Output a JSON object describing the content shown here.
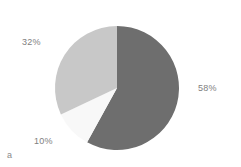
{
  "figure": {
    "caption": "a",
    "background_color": "#ffffff",
    "label_color": "#808080"
  },
  "chart_data": {
    "type": "pie",
    "title": "",
    "xlabel": "",
    "ylabel": "",
    "legend": "none",
    "grid": false,
    "start_angle_deg": 0,
    "direction": "clockwise",
    "categories": [
      "58%",
      "10%",
      "32%"
    ],
    "values": [
      58,
      10,
      32
    ],
    "labels": [
      "58%",
      "10%",
      "32%"
    ],
    "colors": [
      "#6e6e6e",
      "#f8f8f8",
      "#c8c8c8"
    ],
    "slices": [
      {
        "label": "58%",
        "value": 58,
        "color": "#6e6e6e",
        "start_angle_deg": 0,
        "end_angle_deg": 208.8
      },
      {
        "label": "10%",
        "value": 10,
        "color": "#f8f8f8",
        "start_angle_deg": 208.8,
        "end_angle_deg": 244.8
      },
      {
        "label": "32%",
        "value": 32,
        "color": "#c8c8c8",
        "start_angle_deg": 244.8,
        "end_angle_deg": 360
      }
    ],
    "geometry": {
      "center_x": 117,
      "center_y": 88,
      "radius": 62
    }
  }
}
